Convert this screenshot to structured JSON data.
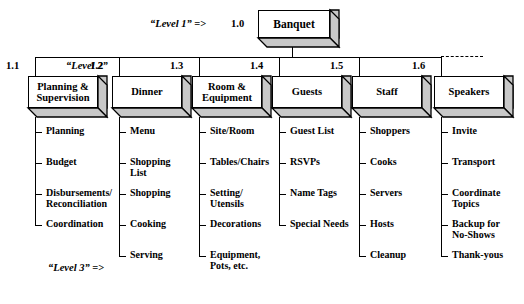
{
  "diagram": {
    "type": "work-breakdown-structure",
    "annotations": {
      "level1": "“Level 1” =>",
      "level2": "“Level 2”",
      "level3": "“Level 3” =>"
    },
    "root": {
      "number": "1.0",
      "label": "Banquet"
    },
    "branches": [
      {
        "number": "1.1",
        "label": "Planning &\nSupervision",
        "tasks": [
          "Planning",
          "Budget",
          "Disbursements/\nReconciliation",
          "Coordination"
        ]
      },
      {
        "number": "1.2",
        "label": "Dinner",
        "tasks": [
          "Menu",
          "Shopping\nList",
          "Shopping",
          "Cooking",
          "Serving"
        ]
      },
      {
        "number": "1.3",
        "label": "Room &\nEquipment",
        "tasks": [
          "Site/Room",
          "Tables/Chairs",
          "Setting/\nUtensils",
          "Decorations",
          "Equipment,\nPots, etc."
        ]
      },
      {
        "number": "1.4",
        "label": "Guests",
        "tasks": [
          "Guest List",
          "RSVPs",
          "Name Tags",
          "Special Needs"
        ]
      },
      {
        "number": "1.5",
        "label": "Staff",
        "tasks": [
          "Shoppers",
          "Cooks",
          "Servers",
          "Hosts",
          "Cleanup"
        ]
      },
      {
        "number": "1.6",
        "label": "Speakers",
        "tasks": [
          "Invite",
          "Transport",
          "Coordinate\nTopics",
          "Backup for\nNo-Shows",
          "Thank-yous"
        ]
      }
    ],
    "colors": {
      "line": "#000000",
      "box_face": "#ffffff",
      "box_extrude": "#c8c8c8",
      "background": "#ffffff"
    }
  }
}
